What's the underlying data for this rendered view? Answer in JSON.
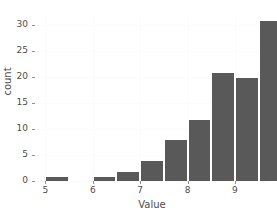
{
  "chart_data": {
    "type": "bar",
    "title": "",
    "subtitle": "",
    "xlabel": "Value",
    "ylabel": "count",
    "xlim": [
      4.78,
      9.72
    ],
    "ylim": [
      0,
      32.55
    ],
    "xticks": [
      5,
      6,
      7,
      8,
      9
    ],
    "xticklabels": [
      "5",
      "6",
      "7",
      "8",
      "9"
    ],
    "yticks": [
      0,
      5,
      10,
      15,
      20,
      25,
      30
    ],
    "yticklabels": [
      "0",
      "5",
      "10",
      "15",
      "20",
      "25",
      "30"
    ],
    "grid": false,
    "legend": null,
    "bar_color": "#595959",
    "bar_edge_color": "#ffffff",
    "background": "#ffffff",
    "bin_width": 0.5,
    "bins": [
      {
        "left": 5.0,
        "right": 5.5,
        "center": 5.25,
        "count": 1
      },
      {
        "left": 5.5,
        "right": 6.0,
        "center": 5.75,
        "count": 0
      },
      {
        "left": 6.0,
        "right": 6.5,
        "center": 6.25,
        "count": 1
      },
      {
        "left": 6.5,
        "right": 7.0,
        "center": 6.75,
        "count": 2
      },
      {
        "left": 7.0,
        "right": 7.5,
        "center": 7.25,
        "count": 4
      },
      {
        "left": 7.5,
        "right": 8.0,
        "center": 7.75,
        "count": 8
      },
      {
        "left": 8.0,
        "right": 8.5,
        "center": 8.25,
        "count": 12
      },
      {
        "left": 8.5,
        "right": 9.0,
        "center": 8.75,
        "count": 21
      },
      {
        "left": 9.0,
        "right": 9.5,
        "center": 9.25,
        "count": 20
      },
      {
        "left": 9.5,
        "right": 10.0,
        "center": 9.75,
        "count": 31
      }
    ],
    "categories": [
      "5.25",
      "5.75",
      "6.25",
      "6.75",
      "7.25",
      "7.75",
      "8.25",
      "8.75",
      "9.25",
      "9.75"
    ],
    "values": [
      1,
      0,
      1,
      2,
      4,
      8,
      12,
      21,
      20,
      31
    ]
  }
}
